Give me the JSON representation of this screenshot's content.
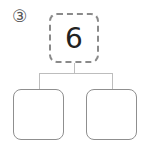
{
  "problem": {
    "number_label": "③",
    "top_value": "6",
    "left_value": "",
    "right_value": ""
  }
}
